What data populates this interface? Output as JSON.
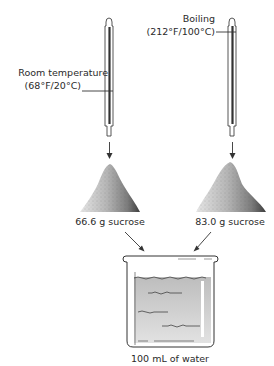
{
  "diagram": {
    "left_thermometer": {
      "label_line1": "Room temperature",
      "label_line2": "(68°F/20°C)"
    },
    "right_thermometer": {
      "label_line1": "Boiling",
      "label_line2": "(212°F/100°C)"
    },
    "left_pile": {
      "label": "66.6 g sucrose"
    },
    "right_pile": {
      "label": "83.0 g sucrose"
    },
    "beaker": {
      "label": "100 mL of water"
    },
    "colors": {
      "line": "#2b2b2b",
      "pile_light": "#d8d8d8",
      "pile_dark": "#4a4a4a",
      "water": "#c9c9c9"
    }
  }
}
